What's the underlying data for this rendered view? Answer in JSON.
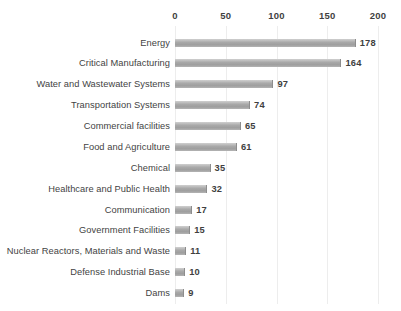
{
  "chart_data": {
    "type": "bar",
    "orientation": "horizontal",
    "title": "",
    "subtitle": "",
    "xlabel": "",
    "ylabel": "",
    "xlim": [
      0,
      200
    ],
    "ticks": [
      "0",
      "50",
      "100",
      "150",
      "200"
    ],
    "tick_values": [
      0,
      50,
      100,
      150,
      200
    ],
    "grid": true,
    "grid_axis": "x",
    "legend": false,
    "legend_position": "none",
    "bar_color": "#a9a9a9",
    "bar_edge_color": "#8d8d8d",
    "label_color": "#434343",
    "value_label_color": "#3f3f3f",
    "background": "#ffffff",
    "categories": [
      "Energy",
      "Critical Manufacturing",
      "Water and Wastewater Systems",
      "Transportation Systems",
      "Commercial facilities",
      "Food and Agriculture",
      "Chemical",
      "Healthcare and Public Health",
      "Communication",
      "Government Facilities",
      "Nuclear Reactors, Materials and Waste",
      "Defense Industrial Base",
      "Dams"
    ],
    "values": [
      178,
      164,
      97,
      74,
      65,
      61,
      35,
      32,
      17,
      15,
      11,
      10,
      9
    ],
    "value_labels": [
      "178",
      "164",
      "97",
      "74",
      "65",
      "61",
      "35",
      "32",
      "17",
      "15",
      "11",
      "10",
      "9"
    ]
  }
}
